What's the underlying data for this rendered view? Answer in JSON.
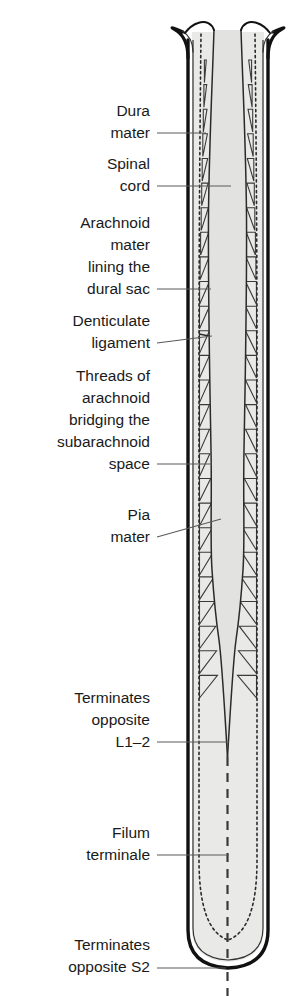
{
  "figure": {
    "background_color": "#ffffff",
    "ink_color": "#1a1a1a",
    "leader_color": "#5a5a5a",
    "subarachnoid_fill": "#e9e9e7",
    "cord_fill": "#e2e2e0",
    "dura_fill": "#ffffff"
  },
  "labels": [
    {
      "id": "dura-mater",
      "lines": [
        "Dura",
        "mater"
      ],
      "anchor_x": 150,
      "lines_y": [
        116,
        138
      ],
      "leader": {
        "x1": 157,
        "y1": 133,
        "x2": 206,
        "y2": 133
      }
    },
    {
      "id": "spinal-cord",
      "lines": [
        "Spinal",
        "cord"
      ],
      "anchor_x": 150,
      "lines_y": [
        169,
        191
      ],
      "leader": {
        "x1": 157,
        "y1": 186,
        "x2": 231,
        "y2": 186
      }
    },
    {
      "id": "arachnoid-mater-lining-dural-sac",
      "lines": [
        "Arachnoid",
        "mater",
        "lining the",
        "dural sac"
      ],
      "anchor_x": 150,
      "lines_y": [
        228,
        250,
        272,
        294
      ],
      "leader": {
        "x1": 157,
        "y1": 289,
        "x2": 211,
        "y2": 289
      }
    },
    {
      "id": "denticulate-ligament",
      "lines": [
        "Denticulate",
        "ligament"
      ],
      "anchor_x": 150,
      "lines_y": [
        326,
        348
      ],
      "leader": {
        "x1": 157,
        "y1": 343,
        "x2": 212,
        "y2": 336
      }
    },
    {
      "id": "threads-of-arachnoid",
      "lines": [
        "Threads of",
        "arachnoid",
        "bridging the",
        "subarachnoid",
        "space"
      ],
      "anchor_x": 150,
      "lines_y": [
        381,
        403,
        425,
        447,
        469
      ],
      "leader": {
        "x1": 157,
        "y1": 464,
        "x2": 212,
        "y2": 464
      }
    },
    {
      "id": "pia-mater",
      "lines": [
        "Pia",
        "mater"
      ],
      "anchor_x": 150,
      "lines_y": [
        520,
        542
      ],
      "leader": {
        "x1": 157,
        "y1": 537,
        "x2": 221,
        "y2": 519
      }
    },
    {
      "id": "terminates-opposite-l1-2",
      "lines": [
        "Terminates",
        "opposite",
        "L1–2"
      ],
      "anchor_x": 150,
      "lines_y": [
        703,
        725,
        747
      ],
      "leader": {
        "x1": 157,
        "y1": 742,
        "x2": 229,
        "y2": 742
      }
    },
    {
      "id": "filum-terminale",
      "lines": [
        "Filum",
        "terminale"
      ],
      "anchor_x": 150,
      "lines_y": [
        838,
        860
      ],
      "leader": {
        "x1": 157,
        "y1": 855,
        "x2": 229,
        "y2": 855
      }
    },
    {
      "id": "terminates-opposite-s2",
      "lines": [
        "Terminates",
        "opposite S2"
      ],
      "anchor_x": 150,
      "lines_y": [
        950,
        972
      ],
      "leader": {
        "x1": 157,
        "y1": 968,
        "x2": 226,
        "y2": 968
      }
    }
  ],
  "anatomy": {
    "dura_outer_left_x": 185,
    "dura_outer_right_x": 271,
    "dural_sac_top_y": 30,
    "dural_sac_bottom_y": 970,
    "cord_termination_y": 758,
    "threads_count": 26,
    "threads_top_y": 60,
    "threads_bottom_y": 700
  }
}
